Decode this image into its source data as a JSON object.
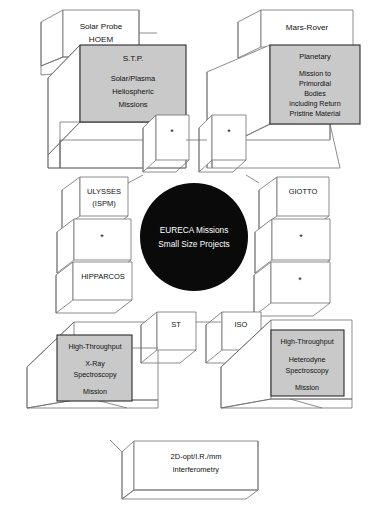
{
  "diagram": {
    "title": "EURECA Missions Small Size Projects",
    "style": {
      "gray_fill": "#c9c9c9",
      "white_fill": "#ffffff",
      "core_fill": "#0a0a0a",
      "line_color": "#6f6f6f",
      "background": "#ffffff"
    },
    "core": {
      "line1": "EURECA Missions",
      "line2": "Small Size Projects"
    },
    "blocks": {
      "solar_probe": {
        "line1": "Solar Probe",
        "line2": "HOEM"
      },
      "stp": {
        "line1": "S.T.P.",
        "line2": "Solar/Plasma",
        "line3": "Heliospheric",
        "line4": "Missions"
      },
      "mars_rover": {
        "line1": "Mars-Rover"
      },
      "planetary": {
        "line1": "Planetary",
        "line2": "Mission to",
        "line3": "Primordial",
        "line4": "Bodies",
        "line5": "including Return",
        "line6": "Pristine Material"
      },
      "ulysses": {
        "line1": "ULYSSES",
        "line2": "(ISPM)"
      },
      "hipparcos": {
        "line1": "HIPPARCOS"
      },
      "giotto": {
        "line1": "GIOTTO"
      },
      "st": {
        "line1": "ST"
      },
      "iso": {
        "line1": "ISO"
      },
      "xray": {
        "line1": "High-Throughput",
        "line2": "X-Ray",
        "line3": "Spectroscopy",
        "line4": "Mission"
      },
      "heterodyne": {
        "line1": "High-Throughput",
        "line2": "Heterodyne",
        "line3": "Spectroscopy",
        "line4": "Mission"
      },
      "interferometry": {
        "line1": "2D-opt/I.R./mm",
        "line2": "interferometry"
      },
      "placeholders": {
        "marker": "*",
        "count": 6,
        "labels": [
          "*",
          "*",
          "*",
          "*",
          "*",
          "*"
        ]
      }
    }
  }
}
